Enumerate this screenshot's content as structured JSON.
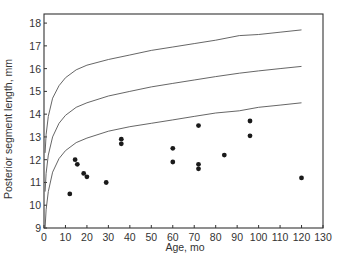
{
  "chart_data": {
    "type": "scatter",
    "title": "",
    "xlabel": "Age, mo",
    "ylabel": "Posterior segment length, mm",
    "xlim": [
      0,
      130
    ],
    "ylim": [
      9,
      18.4
    ],
    "grid": false,
    "legend": null,
    "x_ticks": [
      0,
      10,
      20,
      30,
      40,
      50,
      60,
      70,
      80,
      90,
      100,
      110,
      120,
      130
    ],
    "y_ticks": [
      9,
      10,
      11,
      12,
      13,
      14,
      15,
      16,
      17,
      18
    ],
    "series": [
      {
        "name": "Observed patients",
        "kind": "scatter",
        "points": [
          [
            12,
            10.5
          ],
          [
            14.5,
            12.0
          ],
          [
            15.5,
            11.8
          ],
          [
            18.5,
            11.4
          ],
          [
            20,
            11.25
          ],
          [
            29,
            11.0
          ],
          [
            36,
            12.9
          ],
          [
            36,
            12.7
          ],
          [
            60,
            12.5
          ],
          [
            60,
            11.9
          ],
          [
            72,
            13.5
          ],
          [
            72,
            11.8
          ],
          [
            72,
            11.6
          ],
          [
            84,
            12.2
          ],
          [
            96,
            13.7
          ],
          [
            96,
            13.05
          ],
          [
            120,
            11.2
          ]
        ]
      },
      {
        "name": "Upper reference curve",
        "kind": "line",
        "points": [
          [
            0.5,
            12.3
          ],
          [
            1,
            13.1
          ],
          [
            2,
            13.9
          ],
          [
            4,
            14.7
          ],
          [
            7,
            15.25
          ],
          [
            10,
            15.6
          ],
          [
            15,
            15.95
          ],
          [
            20,
            16.15
          ],
          [
            30,
            16.4
          ],
          [
            40,
            16.6
          ],
          [
            50,
            16.8
          ],
          [
            60,
            16.95
          ],
          [
            70,
            17.1
          ],
          [
            80,
            17.25
          ],
          [
            91,
            17.45
          ],
          [
            100,
            17.5
          ],
          [
            110,
            17.6
          ],
          [
            120,
            17.7
          ]
        ]
      },
      {
        "name": "Middle reference curve",
        "kind": "line",
        "points": [
          [
            0.5,
            10.6
          ],
          [
            1,
            11.4
          ],
          [
            2,
            12.2
          ],
          [
            4,
            13.0
          ],
          [
            7,
            13.6
          ],
          [
            10,
            13.95
          ],
          [
            15,
            14.3
          ],
          [
            20,
            14.5
          ],
          [
            30,
            14.8
          ],
          [
            40,
            15.0
          ],
          [
            50,
            15.2
          ],
          [
            60,
            15.35
          ],
          [
            70,
            15.5
          ],
          [
            80,
            15.65
          ],
          [
            91,
            15.8
          ],
          [
            100,
            15.9
          ],
          [
            110,
            16.0
          ],
          [
            120,
            16.1
          ]
        ]
      },
      {
        "name": "Lower reference curve",
        "kind": "line",
        "points": [
          [
            0.5,
            9.0
          ],
          [
            1,
            9.8
          ],
          [
            2,
            10.6
          ],
          [
            4,
            11.45
          ],
          [
            7,
            12.05
          ],
          [
            10,
            12.4
          ],
          [
            15,
            12.75
          ],
          [
            20,
            12.95
          ],
          [
            30,
            13.25
          ],
          [
            40,
            13.45
          ],
          [
            50,
            13.6
          ],
          [
            60,
            13.75
          ],
          [
            70,
            13.9
          ],
          [
            80,
            14.05
          ],
          [
            91,
            14.15
          ],
          [
            100,
            14.3
          ],
          [
            110,
            14.4
          ],
          [
            120,
            14.5
          ]
        ]
      }
    ],
    "colors": {
      "axis": "#333333",
      "curve": "#555555",
      "point": "#1a1a1a"
    }
  }
}
